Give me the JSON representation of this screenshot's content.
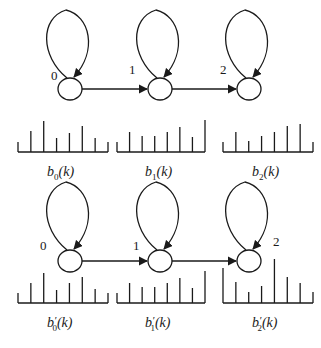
{
  "diagram": {
    "type": "hmm-state-chains",
    "rows": [
      {
        "name": "original",
        "states": [
          {
            "label": "0",
            "cx": 70,
            "cy": 89,
            "label_x": 51,
            "label_y": 80
          },
          {
            "label": "1",
            "cx": 160,
            "cy": 89,
            "label_x": 129,
            "label_y": 74
          },
          {
            "label": "2",
            "cx": 249,
            "cy": 89,
            "label_x": 220,
            "label_y": 74
          }
        ],
        "histograms": [
          {
            "caption_base": "b",
            "caption_sub": "0",
            "caption_prime": "",
            "caption_arg": "(k)",
            "x0": 18,
            "x1": 108,
            "baseline": 152,
            "heights": [
              10,
              21,
              31,
              14,
              19,
              26,
              14,
              10
            ]
          },
          {
            "caption_base": "b",
            "caption_sub": "1",
            "caption_prime": "",
            "caption_arg": "(k)",
            "x0": 117,
            "x1": 205,
            "baseline": 152,
            "heights": [
              10,
              20,
              16,
              16,
              20,
              25,
              15,
              32
            ]
          },
          {
            "caption_base": "b",
            "caption_sub": "2",
            "caption_prime": "",
            "caption_arg": "(k)",
            "x0": 223,
            "x1": 313,
            "baseline": 152,
            "heights": [
              10,
              20,
              11,
              16,
              20,
              26,
              28,
              10
            ]
          }
        ]
      },
      {
        "name": "modified",
        "states": [
          {
            "label": "0",
            "cx": 70,
            "cy": 261,
            "label_x": 40,
            "label_y": 250
          },
          {
            "label": "1",
            "cx": 160,
            "cy": 261,
            "label_x": 133,
            "label_y": 250
          },
          {
            "label": "2",
            "cx": 249,
            "cy": 261,
            "label_x": 273,
            "label_y": 246
          }
        ],
        "histograms": [
          {
            "caption_base": "b",
            "caption_sub": "0",
            "caption_prime": "′",
            "caption_arg": "(k)",
            "x0": 18,
            "x1": 108,
            "baseline": 303,
            "heights": [
              10,
              20,
              30,
              13,
              20,
              26,
              14,
              10
            ]
          },
          {
            "caption_base": "b",
            "caption_sub": "1",
            "caption_prime": "′",
            "caption_arg": "(k)",
            "x0": 117,
            "x1": 205,
            "baseline": 303,
            "heights": [
              10,
              20,
              16,
              16,
              20,
              25,
              15,
              32
            ]
          },
          {
            "caption_base": "b",
            "caption_sub": "2",
            "caption_prime": "′",
            "caption_arg": "(k)",
            "x0": 223,
            "x1": 313,
            "baseline": 303,
            "heights": [
              35,
              21,
              11,
              17,
              44,
              26,
              20,
              11
            ]
          }
        ]
      }
    ],
    "transitions": [
      {
        "from": "0",
        "to": "1",
        "type": "forward"
      },
      {
        "from": "1",
        "to": "2",
        "type": "forward"
      },
      {
        "from": "0",
        "to": "0",
        "type": "self-loop"
      },
      {
        "from": "1",
        "to": "1",
        "type": "self-loop"
      },
      {
        "from": "2",
        "to": "2",
        "type": "self-loop"
      }
    ],
    "captions": {
      "top": [
        "b0(k)",
        "b1(k)",
        "b2(k)"
      ],
      "bottom": [
        "b'0(k)",
        "b'1(k)",
        "b'2(k)"
      ]
    },
    "colors": {
      "ink": "#1a1a1a",
      "background": "#ffffff"
    }
  }
}
